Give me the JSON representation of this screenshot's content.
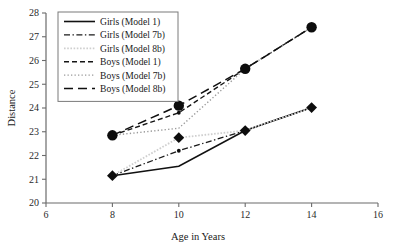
{
  "chart_data": {
    "type": "line",
    "title": "",
    "xlabel": "Age in Years",
    "ylabel": "Distance",
    "x": [
      8,
      10,
      12,
      14
    ],
    "xlim": [
      6,
      16
    ],
    "ylim": [
      20,
      28
    ],
    "xticks": [
      "6",
      "8",
      "10",
      "12",
      "14",
      "16"
    ],
    "yticks": [
      "20",
      "21",
      "22",
      "23",
      "24",
      "25",
      "26",
      "27",
      "28"
    ],
    "grid": false,
    "legend_position": "upper-left-inside",
    "series": [
      {
        "name": "Girls (Model 1)",
        "style": "solid",
        "color": "#111111",
        "width": 1.6,
        "marker": "diamond",
        "marker_points": [
          0,
          2,
          3
        ],
        "values": [
          21.15,
          21.55,
          23.05,
          24.02
        ]
      },
      {
        "name": "Girls (Model 7b)",
        "style": "dashdot",
        "color": "#1a1a1a",
        "width": 1.3,
        "marker": "smalldot",
        "marker_points": [
          1
        ],
        "values": [
          21.15,
          22.2,
          23.05,
          24.02
        ]
      },
      {
        "name": "Girls (Model 8b)",
        "style": "dotted-light",
        "color": "#cfcfcf",
        "width": 1.8,
        "marker": "diamond",
        "marker_points": [
          1
        ],
        "values": [
          21.15,
          22.75,
          23.05,
          24.02
        ]
      },
      {
        "name": "Boys (Model 1)",
        "style": "dashed",
        "color": "#151515",
        "width": 1.4,
        "marker": "smalldot",
        "marker_points": [
          1
        ],
        "values": [
          22.85,
          23.8,
          25.65,
          27.4
        ]
      },
      {
        "name": "Boys (Model 7b)",
        "style": "dotted-fine",
        "color": "#9a9a9a",
        "width": 1.4,
        "marker": "none",
        "marker_points": [],
        "values": [
          22.85,
          23.15,
          25.65,
          27.4
        ]
      },
      {
        "name": "Boys (Model 8b)",
        "style": "longdash",
        "color": "#0f0f0f",
        "width": 1.5,
        "marker": "circle",
        "marker_points": [
          0,
          1,
          2,
          3
        ],
        "values": [
          22.85,
          24.1,
          25.65,
          27.4
        ]
      }
    ]
  },
  "legend": {
    "items": [
      "Girls (Model 1)",
      "Girls (Model 7b)",
      "Girls (Model 8b)",
      "Boys (Model 1)",
      "Boys (Model 7b)",
      "Boys (Model 8b)"
    ]
  }
}
